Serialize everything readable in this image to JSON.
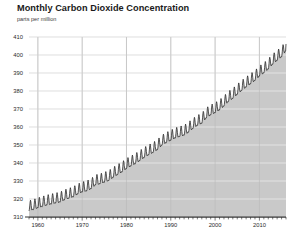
{
  "chart_data": {
    "type": "line",
    "title": "Monthly Carbon Dioxide Concentration",
    "subtitle": "parts per million",
    "xlabel": "",
    "ylabel": "",
    "units": "parts per million",
    "grid": true,
    "legend": "none",
    "fill_below_curve": true,
    "xlim": [
      1958,
      2016
    ],
    "ylim": [
      310,
      410
    ],
    "ytick_labels": [
      "310",
      "320",
      "330",
      "340",
      "350",
      "360",
      "370",
      "380",
      "390",
      "400",
      "410"
    ],
    "ytick_values": [
      310,
      320,
      330,
      340,
      350,
      360,
      370,
      380,
      390,
      400,
      410
    ],
    "xtick_labels": [
      "1960",
      "1970",
      "1980",
      "1990",
      "2000",
      "2010"
    ],
    "xtick_values": [
      1960,
      1970,
      1980,
      1990,
      2000,
      2010
    ],
    "minor_xtick_interval": 1,
    "seasonal_amplitude_ppm": 3.2,
    "series": [
      {
        "name": "Monthly mean CO2",
        "color": "#222222",
        "annual_means": [
          {
            "year": 1958,
            "value": 315.3
          },
          {
            "year": 1959,
            "value": 315.98
          },
          {
            "year": 1960,
            "value": 316.91
          },
          {
            "year": 1961,
            "value": 317.64
          },
          {
            "year": 1962,
            "value": 318.45
          },
          {
            "year": 1963,
            "value": 318.99
          },
          {
            "year": 1964,
            "value": 319.62
          },
          {
            "year": 1965,
            "value": 320.04
          },
          {
            "year": 1966,
            "value": 321.37
          },
          {
            "year": 1967,
            "value": 322.18
          },
          {
            "year": 1968,
            "value": 323.05
          },
          {
            "year": 1969,
            "value": 324.62
          },
          {
            "year": 1970,
            "value": 325.68
          },
          {
            "year": 1971,
            "value": 326.32
          },
          {
            "year": 1972,
            "value": 327.46
          },
          {
            "year": 1973,
            "value": 329.68
          },
          {
            "year": 1974,
            "value": 330.19
          },
          {
            "year": 1975,
            "value": 331.12
          },
          {
            "year": 1976,
            "value": 332.03
          },
          {
            "year": 1977,
            "value": 333.84
          },
          {
            "year": 1978,
            "value": 335.41
          },
          {
            "year": 1979,
            "value": 336.84
          },
          {
            "year": 1980,
            "value": 338.76
          },
          {
            "year": 1981,
            "value": 340.12
          },
          {
            "year": 1982,
            "value": 341.48
          },
          {
            "year": 1983,
            "value": 343.15
          },
          {
            "year": 1984,
            "value": 344.87
          },
          {
            "year": 1985,
            "value": 346.35
          },
          {
            "year": 1986,
            "value": 347.61
          },
          {
            "year": 1987,
            "value": 349.31
          },
          {
            "year": 1988,
            "value": 351.69
          },
          {
            "year": 1989,
            "value": 353.2
          },
          {
            "year": 1990,
            "value": 354.45
          },
          {
            "year": 1991,
            "value": 355.7
          },
          {
            "year": 1992,
            "value": 356.54
          },
          {
            "year": 1993,
            "value": 357.21
          },
          {
            "year": 1994,
            "value": 358.96
          },
          {
            "year": 1995,
            "value": 360.97
          },
          {
            "year": 1996,
            "value": 362.74
          },
          {
            "year": 1997,
            "value": 363.88
          },
          {
            "year": 1998,
            "value": 366.84
          },
          {
            "year": 1999,
            "value": 368.54
          },
          {
            "year": 2000,
            "value": 369.71
          },
          {
            "year": 2001,
            "value": 371.32
          },
          {
            "year": 2002,
            "value": 373.45
          },
          {
            "year": 2003,
            "value": 375.98
          },
          {
            "year": 2004,
            "value": 377.7
          },
          {
            "year": 2005,
            "value": 379.98
          },
          {
            "year": 2006,
            "value": 382.09
          },
          {
            "year": 2007,
            "value": 384.02
          },
          {
            "year": 2008,
            "value": 385.83
          },
          {
            "year": 2009,
            "value": 387.64
          },
          {
            "year": 2010,
            "value": 390.1
          },
          {
            "year": 2011,
            "value": 391.85
          },
          {
            "year": 2012,
            "value": 394.06
          },
          {
            "year": 2013,
            "value": 396.74
          },
          {
            "year": 2014,
            "value": 398.81
          },
          {
            "year": 2015,
            "value": 400.83
          },
          {
            "year": 2016,
            "value": 404.21
          }
        ]
      }
    ],
    "colors": {
      "line": "#222222",
      "area_fill": "#c9c9c9",
      "gridline": "#d2d2d2",
      "axis": "#333333",
      "text": "#2b2b2b",
      "background": "#ffffff"
    }
  }
}
